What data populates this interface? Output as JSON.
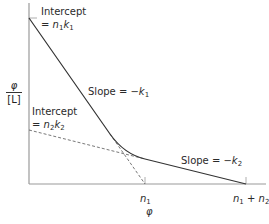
{
  "diagram": {
    "y_axis_label": {
      "numerator": "φ",
      "denominator": "[L]"
    },
    "x_axis_label": "φ",
    "annotations": {
      "intercept1": {
        "line1": "Intercept",
        "line2_prefix": "= ",
        "n": "n",
        "n_sub": "1",
        "k": "k",
        "k_sub": "1"
      },
      "intercept2": {
        "line1": "Intercept",
        "line2_prefix": "= ",
        "n": "n",
        "n_sub": "2",
        "k": "k",
        "k_sub": "2"
      },
      "slope1": {
        "prefix": "Slope = −",
        "k": "k",
        "k_sub": "1"
      },
      "slope2": {
        "prefix": "Slope = −",
        "k": "k",
        "k_sub": "2"
      }
    },
    "x_ticks": {
      "tick1": {
        "n": "n",
        "sub": "1"
      },
      "tick2": {
        "n1": "n",
        "sub1": "1",
        "plus": " + ",
        "n2": "n",
        "sub2": "2"
      }
    },
    "colors": {
      "axis": "#9a9a9a",
      "curve": "#333333",
      "dashed": "#555555"
    }
  }
}
